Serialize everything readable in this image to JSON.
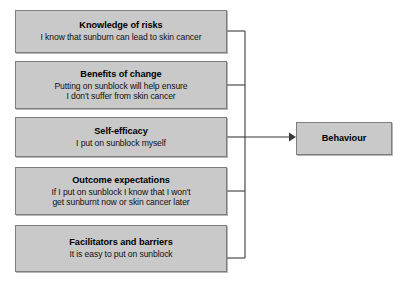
{
  "diagram": {
    "type": "flow-diagram",
    "orientation": "left-to-right",
    "determinants": [
      {
        "id": "knowledge-of-risks",
        "title": "Knowledge of risks",
        "description": "I know that sunburn can lead to skin cancer"
      },
      {
        "id": "benefits-of-change",
        "title": "Benefits of change",
        "description": "Putting on sunblock will help ensure\nI don't suffer from skin cancer"
      },
      {
        "id": "self-efficacy",
        "title": "Self-efficacy",
        "description": "I put on sunblock myself"
      },
      {
        "id": "outcome-expectations",
        "title": "Outcome expectations",
        "description": "If I put on sunblock I know that I won't\nget sunburnt now or skin cancer later"
      },
      {
        "id": "facilitators-and-barriers",
        "title": "Facilitators and barriers",
        "description": "It is easy to put on sunblock"
      }
    ],
    "outcome": {
      "id": "behaviour",
      "title": "Behaviour"
    },
    "connector": {
      "style": "orthogonal-trunk-with-arrowhead",
      "arrow_target": "behaviour"
    },
    "colors": {
      "box_fill": "#c9c9c9",
      "box_border": "#7d7d7d",
      "line": "#3a3a3a",
      "text": "#000000",
      "background": "#ffffff"
    }
  }
}
